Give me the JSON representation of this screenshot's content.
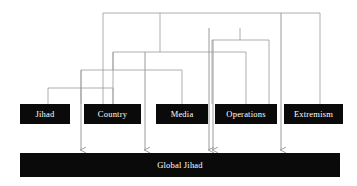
{
  "diagram": {
    "type": "hierarchical-cluster-flow",
    "title_text": "",
    "canvas": {
      "width": 357,
      "height": 186,
      "background": "#ffffff"
    },
    "colors": {
      "node_fill": "#0a0a0a",
      "node_text": "#ffffff",
      "connector": "#9a9a9a",
      "arrow": "#9a9a9a",
      "background": "#ffffff"
    },
    "nodes": [
      {
        "id": "jihad",
        "label": "Jihad",
        "x": 20,
        "y": 104,
        "w": 50,
        "h": 20
      },
      {
        "id": "country",
        "label": "Country",
        "x": 84,
        "y": 104,
        "w": 57,
        "h": 20
      },
      {
        "id": "media",
        "label": "Media",
        "x": 156,
        "y": 104,
        "w": 52,
        "h": 20
      },
      {
        "id": "operations",
        "label": "Operations",
        "x": 215,
        "y": 104,
        "w": 62,
        "h": 20
      },
      {
        "id": "extremism",
        "label": "Extremism",
        "x": 284,
        "y": 104,
        "w": 59,
        "h": 20
      }
    ],
    "target": {
      "id": "global-jihad",
      "label": "Global Jihad",
      "x": 20,
      "y": 153,
      "w": 320,
      "h": 24
    },
    "brackets": [
      {
        "id": "bracket-jihad-country",
        "y": 88,
        "x1": 48,
        "x2": 113,
        "stem_x": 81,
        "stem_to_y": 70
      },
      {
        "id": "bracket-pair-media",
        "y": 70,
        "x1": 81,
        "x2": 182,
        "stem_x": 113,
        "stem_to_y": 52
      },
      {
        "id": "bracket-group-operations",
        "y": 52,
        "x1": 113,
        "x2": 246,
        "stem_x": 160,
        "stem_to_y": 13
      },
      {
        "id": "bracket-inner-operations",
        "y": 40,
        "x1": 212,
        "x2": 269,
        "stem_x": 240,
        "stem_to_y": 28
      },
      {
        "id": "bracket-top-extremism",
        "y": 13,
        "x1": 103,
        "x2": 320,
        "stem_x": 103,
        "stem_to_y": 13
      }
    ],
    "arrows": [
      {
        "id": "arrow-jihad",
        "x": 81,
        "from_y": 88,
        "to_y": 150
      },
      {
        "id": "arrow-country",
        "x": 145,
        "from_y": 52,
        "to_y": 150
      },
      {
        "id": "arrow-media",
        "x": 209,
        "from_y": 28,
        "to_y": 150
      },
      {
        "id": "arrow-operations",
        "x": 213,
        "from_y": 40,
        "to_y": 150
      },
      {
        "id": "arrow-extremism",
        "x": 281,
        "from_y": 13,
        "to_y": 150
      }
    ]
  }
}
